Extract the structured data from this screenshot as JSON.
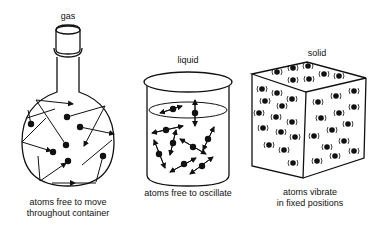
{
  "diagram": {
    "panels": [
      {
        "id": "gas",
        "title": "gas",
        "caption_line1": "atoms free to move",
        "caption_line2": "throughout container",
        "container": "round-bottom flask"
      },
      {
        "id": "liquid",
        "title": "liquid",
        "caption_line1": "atoms free to oscillate",
        "container": "beaker"
      },
      {
        "id": "solid",
        "title": "solid",
        "caption_line1": "atoms vibrate",
        "caption_line2": "in fixed positions",
        "container": "cube"
      }
    ]
  },
  "colors": {
    "ink": "#111111",
    "background": "#ffffff"
  }
}
